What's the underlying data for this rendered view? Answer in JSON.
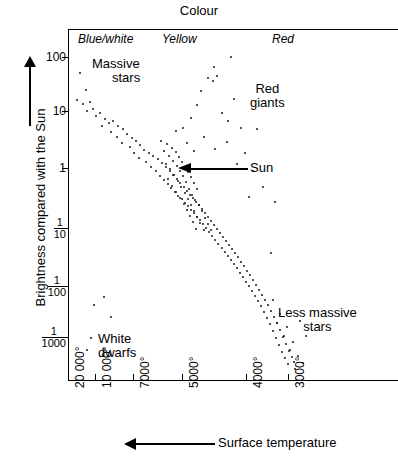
{
  "title": "Colour",
  "axes": {
    "x": {
      "label": "Surface temperature",
      "arrow_direction": "left",
      "ticks": [
        {
          "value": 20000,
          "label": "20 000°",
          "px": 68
        },
        {
          "value": 10000,
          "label": "10 000°",
          "px": 95
        },
        {
          "value": 7000,
          "label": "7000°",
          "px": 133
        },
        {
          "value": 5000,
          "label": "5000°",
          "px": 182
        },
        {
          "value": 4000,
          "label": "4000°",
          "px": 246
        },
        {
          "value": 3000,
          "label": "3000°",
          "px": 288
        }
      ]
    },
    "y": {
      "label": "Brightness compared with the Sun",
      "arrow_direction": "up",
      "ticks": [
        {
          "value": 100,
          "label": "100",
          "frac": null,
          "px": 57
        },
        {
          "value": 10,
          "label": "10",
          "frac": null,
          "px": 111
        },
        {
          "value": 1,
          "label": "1",
          "frac": null,
          "px": 168
        },
        {
          "value": 0.1,
          "label": "",
          "frac": {
            "num": "1",
            "den": "10"
          },
          "px": 228
        },
        {
          "value": 0.01,
          "label": "",
          "frac": {
            "num": "1",
            "den": "100"
          },
          "px": 286
        },
        {
          "value": 0.001,
          "label": "",
          "frac": {
            "num": "1",
            "den": "1000"
          },
          "px": 337
        }
      ]
    }
  },
  "colour_bands": [
    {
      "name": "blue-white",
      "label": "Blue/white"
    },
    {
      "name": "yellow",
      "label": "Yellow"
    },
    {
      "name": "red",
      "label": "Red"
    }
  ],
  "annotations": [
    {
      "name": "massive-stars",
      "line1": "Massive",
      "line2": "stars"
    },
    {
      "name": "red-giants",
      "line1": "Red",
      "line2": "giants"
    },
    {
      "name": "less-massive-stars",
      "line1": "Less massive",
      "line2": "stars"
    },
    {
      "name": "white-dwarfs",
      "line1": "White",
      "line2": "dwarfs"
    },
    {
      "name": "sun",
      "line1": "Sun",
      "line2": ""
    }
  ],
  "chart_data": {
    "type": "scatter",
    "title": "Colour",
    "xlabel": "Surface temperature",
    "ylabel": "Brightness compared with the Sun",
    "x_scale": "reversed-temperature",
    "y_scale": "log",
    "ylim": [
      0.001,
      300
    ],
    "xlim_deg": [
      22000,
      2600
    ],
    "grid": false,
    "legend": false,
    "groups": [
      {
        "name": "main-sequence",
        "comment": "diagonal band from hot/bright upper-left to cool/faint lower-right",
        "points_px": [
          [
            79,
            72
          ],
          [
            85,
            89
          ],
          [
            76,
            99
          ],
          [
            82,
            103
          ],
          [
            89,
            101
          ],
          [
            86,
            110
          ],
          [
            92,
            108
          ],
          [
            95,
            115
          ],
          [
            99,
            112
          ],
          [
            104,
            118
          ],
          [
            108,
            122
          ],
          [
            101,
            125
          ],
          [
            112,
            120
          ],
          [
            117,
            125
          ],
          [
            110,
            131
          ],
          [
            122,
            128
          ],
          [
            116,
            136
          ],
          [
            126,
            133
          ],
          [
            131,
            137
          ],
          [
            121,
            142
          ],
          [
            135,
            140
          ],
          [
            129,
            146
          ],
          [
            139,
            144
          ],
          [
            133,
            152
          ],
          [
            143,
            149
          ],
          [
            148,
            152
          ],
          [
            138,
            157
          ],
          [
            152,
            155
          ],
          [
            145,
            161
          ],
          [
            157,
            158
          ],
          [
            150,
            166
          ],
          [
            161,
            162
          ],
          [
            155,
            170
          ],
          [
            165,
            166
          ],
          [
            159,
            175
          ],
          [
            169,
            170
          ],
          [
            163,
            179
          ],
          [
            172,
            174
          ],
          [
            167,
            183
          ],
          [
            176,
            178
          ],
          [
            170,
            187
          ],
          [
            179,
            182
          ],
          [
            174,
            191
          ],
          [
            183,
            186
          ],
          [
            177,
            195
          ],
          [
            186,
            190
          ],
          [
            181,
            198
          ],
          [
            189,
            194
          ],
          [
            184,
            202
          ],
          [
            192,
            197
          ],
          [
            187,
            205
          ],
          [
            195,
            201
          ],
          [
            190,
            209
          ],
          [
            198,
            204
          ],
          [
            193,
            212
          ],
          [
            201,
            208
          ],
          [
            196,
            216
          ],
          [
            204,
            212
          ],
          [
            199,
            219
          ],
          [
            207,
            216
          ],
          [
            202,
            223
          ],
          [
            210,
            220
          ],
          [
            205,
            227
          ],
          [
            213,
            224
          ],
          [
            208,
            231
          ],
          [
            216,
            228
          ],
          [
            211,
            235
          ],
          [
            219,
            232
          ],
          [
            214,
            239
          ],
          [
            222,
            236
          ],
          [
            217,
            243
          ],
          [
            225,
            240
          ],
          [
            221,
            247
          ],
          [
            228,
            244
          ],
          [
            224,
            251
          ],
          [
            231,
            248
          ],
          [
            227,
            255
          ],
          [
            234,
            252
          ],
          [
            230,
            259
          ],
          [
            237,
            256
          ],
          [
            233,
            263
          ],
          [
            240,
            261
          ],
          [
            236,
            267
          ],
          [
            243,
            265
          ],
          [
            239,
            272
          ],
          [
            246,
            270
          ],
          [
            242,
            276
          ],
          [
            249,
            274
          ],
          [
            245,
            281
          ],
          [
            252,
            279
          ],
          [
            248,
            285
          ],
          [
            255,
            284
          ],
          [
            251,
            290
          ],
          [
            258,
            289
          ],
          [
            254,
            295
          ],
          [
            261,
            294
          ],
          [
            257,
            300
          ],
          [
            264,
            299
          ],
          [
            260,
            305
          ],
          [
            267,
            304
          ],
          [
            263,
            311
          ],
          [
            270,
            310
          ],
          [
            266,
            317
          ],
          [
            273,
            316
          ],
          [
            269,
            323
          ],
          [
            276,
            322
          ],
          [
            272,
            330
          ],
          [
            279,
            329
          ],
          [
            275,
            337
          ],
          [
            282,
            336
          ],
          [
            278,
            344
          ],
          [
            285,
            343
          ],
          [
            281,
            351
          ],
          [
            288,
            350
          ],
          [
            284,
            357
          ],
          [
            291,
            356
          ],
          [
            287,
            363
          ],
          [
            293,
            361
          ]
        ]
      },
      {
        "name": "main-sequence-core-cluster",
        "comment": "dense knot around the Sun near 5000-6000 deg, brightness ~1",
        "points_px": [
          [
            160,
            140
          ],
          [
            166,
            143
          ],
          [
            171,
            147
          ],
          [
            163,
            150
          ],
          [
            175,
            151
          ],
          [
            168,
            155
          ],
          [
            178,
            156
          ],
          [
            172,
            160
          ],
          [
            181,
            161
          ],
          [
            165,
            163
          ],
          [
            176,
            165
          ],
          [
            184,
            166
          ],
          [
            169,
            168
          ],
          [
            179,
            170
          ],
          [
            187,
            171
          ],
          [
            173,
            174
          ],
          [
            182,
            175
          ],
          [
            190,
            176
          ],
          [
            167,
            178
          ],
          [
            177,
            180
          ],
          [
            185,
            181
          ],
          [
            193,
            182
          ],
          [
            171,
            185
          ],
          [
            180,
            186
          ],
          [
            188,
            188
          ],
          [
            196,
            188
          ],
          [
            175,
            191
          ],
          [
            184,
            192
          ],
          [
            191,
            194
          ],
          [
            179,
            197
          ],
          [
            187,
            198
          ],
          [
            194,
            199
          ],
          [
            183,
            203
          ],
          [
            190,
            204
          ],
          [
            198,
            204
          ],
          [
            186,
            209
          ],
          [
            193,
            210
          ],
          [
            201,
            210
          ],
          [
            189,
            215
          ],
          [
            196,
            216
          ],
          [
            204,
            217
          ],
          [
            192,
            221
          ],
          [
            199,
            222
          ],
          [
            207,
            223
          ],
          [
            195,
            228
          ],
          [
            203,
            229
          ],
          [
            210,
            229
          ]
        ]
      },
      {
        "name": "red-giants",
        "comment": "scattered bright stars at cool temperatures, upper right",
        "points_px": [
          [
            230,
            56
          ],
          [
            207,
            77
          ],
          [
            212,
            80
          ],
          [
            216,
            75
          ],
          [
            196,
            104
          ],
          [
            190,
            117
          ],
          [
            221,
            112
          ],
          [
            227,
            120
          ],
          [
            240,
            127
          ],
          [
            175,
            130
          ],
          [
            182,
            127
          ],
          [
            203,
            136
          ],
          [
            186,
            142
          ],
          [
            193,
            150
          ],
          [
            214,
            148
          ],
          [
            226,
            141
          ],
          [
            244,
            152
          ],
          [
            236,
            163
          ],
          [
            252,
            170
          ],
          [
            262,
            186
          ],
          [
            248,
            196
          ],
          [
            274,
            201
          ],
          [
            270,
            252
          ],
          [
            213,
            66
          ],
          [
            200,
            90
          ],
          [
            233,
            98
          ],
          [
            256,
            128
          ]
        ]
      },
      {
        "name": "white-dwarfs",
        "comment": "hot but faint stars, lower left",
        "points_px": [
          [
            93,
            304
          ],
          [
            90,
            337
          ],
          [
            103,
            296
          ],
          [
            86,
            349
          ],
          [
            110,
            316
          ]
        ]
      },
      {
        "name": "less-massive-stars-tail",
        "comment": "faint cool stars, lower right of main sequence tail",
        "points_px": [
          [
            272,
            299
          ],
          [
            279,
            313
          ],
          [
            286,
            326
          ],
          [
            292,
            341
          ],
          [
            297,
            355
          ],
          [
            302,
            362
          ],
          [
            289,
            349
          ],
          [
            283,
            335
          ],
          [
            276,
            322
          ],
          [
            294,
            368
          ],
          [
            305,
            335
          ],
          [
            299,
            320
          ]
        ]
      }
    ]
  }
}
